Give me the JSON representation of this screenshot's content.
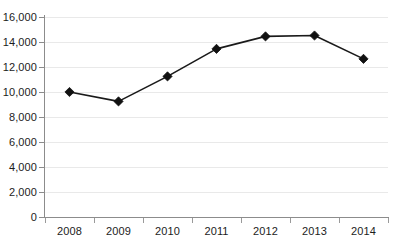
{
  "chart_data": {
    "type": "line",
    "title": "",
    "xlabel": "",
    "ylabel": "",
    "categories": [
      "2008",
      "2009",
      "2010",
      "2011",
      "2012",
      "2013",
      "2014"
    ],
    "values": [
      10000,
      9250,
      11250,
      13450,
      14450,
      14520,
      12650
    ],
    "series": [
      {
        "name": "",
        "values": [
          10000,
          9250,
          11250,
          13450,
          14450,
          14520,
          12650
        ]
      }
    ],
    "ylim": [
      0,
      16000
    ],
    "ytick_values": [
      0,
      2000,
      4000,
      6000,
      8000,
      10000,
      12000,
      14000,
      16000
    ],
    "ytick_labels": [
      "0",
      "2,000",
      "4,000",
      "6,000",
      "8,000",
      "10,000",
      "12,000",
      "14,000",
      "16,000"
    ],
    "xtick_labels": [
      "2008",
      "2009",
      "2010",
      "2011",
      "2012",
      "2013",
      "2014"
    ],
    "grid": true,
    "grid_axis": "y",
    "legend": false,
    "legend_position": "none",
    "marker": "diamond",
    "colors": {
      "line": "#1a1a1a",
      "marker": "#111111",
      "grid": "#e9e9e9",
      "axis": "#8c8c8c",
      "text": "#1c1c1c",
      "background": "#ffffff"
    },
    "annotations": []
  },
  "footer": {
    "caption_cutoff": ""
  }
}
